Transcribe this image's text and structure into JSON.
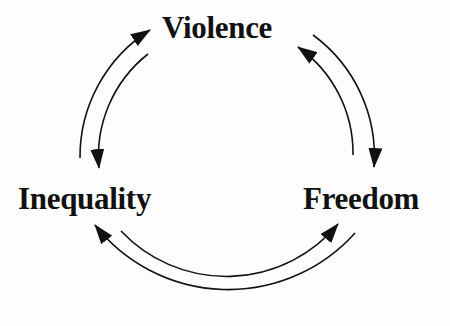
{
  "diagram": {
    "type": "cycle",
    "nodes": [
      {
        "id": "violence",
        "label": "Violence"
      },
      {
        "id": "inequality",
        "label": "Inequality"
      },
      {
        "id": "freedom",
        "label": "Freedom"
      }
    ],
    "edges": [
      {
        "from": "inequality",
        "to": "violence"
      },
      {
        "from": "violence",
        "to": "inequality"
      },
      {
        "from": "violence",
        "to": "freedom"
      },
      {
        "from": "freedom",
        "to": "violence"
      },
      {
        "from": "inequality",
        "to": "freedom"
      },
      {
        "from": "freedom",
        "to": "inequality"
      }
    ],
    "colors": {
      "ink": "#111111",
      "background": "#fdfdfd"
    }
  }
}
